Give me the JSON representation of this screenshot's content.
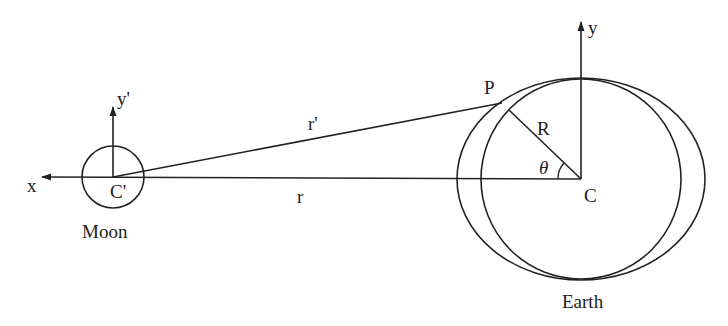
{
  "diagram": {
    "labels": {
      "x_axis": "x",
      "y_axis": "y",
      "y_prime_axis": "y'",
      "moon_center": "C'",
      "earth_center": "C",
      "point": "P",
      "radius": "R",
      "angle": "θ",
      "distance_center": "r",
      "distance_point": "r'",
      "moon": "Moon",
      "earth": "Earth"
    },
    "colors": {
      "stroke": "#222222",
      "background": "#ffffff"
    }
  }
}
